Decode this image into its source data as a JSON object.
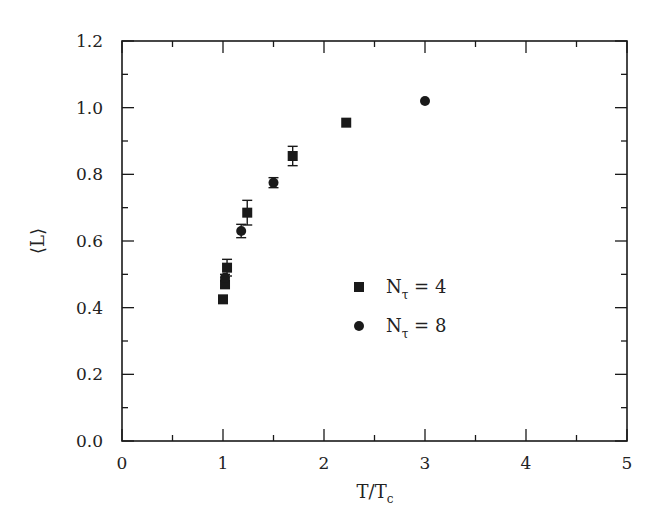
{
  "chart_data": {
    "type": "scatter",
    "title": "",
    "xlabel": "T/T_c",
    "ylabel": "⟨L⟩",
    "xlim": [
      0,
      5
    ],
    "ylim": [
      0.0,
      1.2
    ],
    "x_ticks": [
      "0",
      "1",
      "2",
      "3",
      "4",
      "5"
    ],
    "y_ticks": [
      "0.0",
      "0.2",
      "0.4",
      "0.6",
      "0.8",
      "1.0",
      "1.2"
    ],
    "grid": false,
    "legend_position": "center-right inside plot",
    "series": [
      {
        "name": "N_τ = 4",
        "marker": "square",
        "points": [
          {
            "x": 1.0,
            "y": 0.425,
            "err": 0.0
          },
          {
            "x": 1.02,
            "y": 0.47,
            "err": 0.01
          },
          {
            "x": 1.04,
            "y": 0.52,
            "err": 0.025
          },
          {
            "x": 1.24,
            "y": 0.685,
            "err": 0.037
          },
          {
            "x": 1.69,
            "y": 0.855,
            "err": 0.029
          },
          {
            "x": 2.22,
            "y": 0.955,
            "err": 0.0
          }
        ]
      },
      {
        "name": "N_τ = 8",
        "marker": "circle",
        "points": [
          {
            "x": 1.02,
            "y": 0.49,
            "err": 0.01
          },
          {
            "x": 1.18,
            "y": 0.63,
            "err": 0.02
          },
          {
            "x": 1.5,
            "y": 0.775,
            "err": 0.015
          },
          {
            "x": 3.0,
            "y": 1.02,
            "err": 0.0
          }
        ]
      }
    ]
  },
  "legend": {
    "items": [
      {
        "label_main": "N",
        "label_sub": "τ",
        "label_rest": " = 4",
        "marker": "square"
      },
      {
        "label_main": "N",
        "label_sub": "τ",
        "label_rest": " = 8",
        "marker": "circle"
      }
    ]
  },
  "axes": {
    "xlabel_main": "T/T",
    "xlabel_sub": "c",
    "ylabel": "⟨L⟩"
  },
  "colors": {
    "ink": "#1a1a1a",
    "background": "#ffffff"
  }
}
